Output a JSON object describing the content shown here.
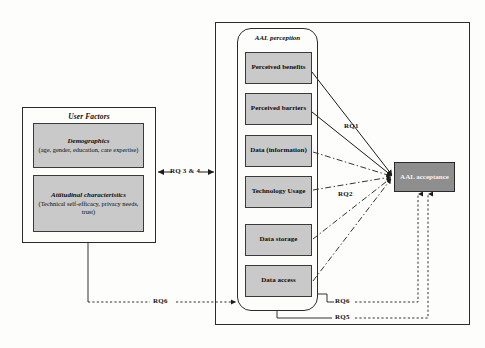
{
  "diagram": {
    "colors": {
      "node_fill": "#c9c9c9",
      "accept_fill": "#8e8e8e",
      "stroke": "#2b2b2b",
      "background": "#fdfdfc"
    }
  },
  "user_factors": {
    "title": "User Factors",
    "items": [
      {
        "heading": "Demographics",
        "detail": "(age, gender, education, care expertise)"
      },
      {
        "heading": "Attitudinal characteristics",
        "detail": "(Technical self-efficacy, privacy needs, trust)"
      }
    ]
  },
  "aal_perception": {
    "title": "AAL perception",
    "nodes": [
      {
        "label": "Perceived benefits",
        "line_style": "solid"
      },
      {
        "label": "Perceived barriers",
        "line_style": "solid"
      },
      {
        "label": "Data (information)",
        "line_style": "dash-dot"
      },
      {
        "label": "Technology Usage",
        "line_style": "dash-dot"
      },
      {
        "label": "Data storage",
        "line_style": "dash-dot"
      },
      {
        "label": "Data access",
        "line_style": "dash-dot"
      }
    ]
  },
  "outcome": {
    "label": "AAL acceptance"
  },
  "relations": [
    {
      "id": "rq1",
      "label": "RQ1"
    },
    {
      "id": "rq2",
      "label": "RQ2"
    },
    {
      "id": "rq34",
      "label": "RQ 3 & 4"
    },
    {
      "id": "rq6_left",
      "label": "RQ6"
    },
    {
      "id": "rq6_right",
      "label": "RQ6"
    },
    {
      "id": "rq5_right",
      "label": "RQ5"
    }
  ]
}
